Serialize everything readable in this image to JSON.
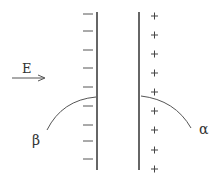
{
  "diagram": {
    "field_label": "E",
    "negative_plate": {
      "charge_symbol": "—",
      "charge_count": 9,
      "sign": "negative"
    },
    "positive_plate": {
      "charge_symbol": "+",
      "charge_count": 9,
      "sign": "positive"
    },
    "particles": [
      {
        "label": "β",
        "name": "beta",
        "deflects_toward": "positive plate"
      },
      {
        "label": "α",
        "name": "alpha",
        "deflects_toward": "negative plate"
      }
    ],
    "colors": {
      "line": "#333333",
      "curve": "#555555",
      "text": "#333333"
    }
  }
}
